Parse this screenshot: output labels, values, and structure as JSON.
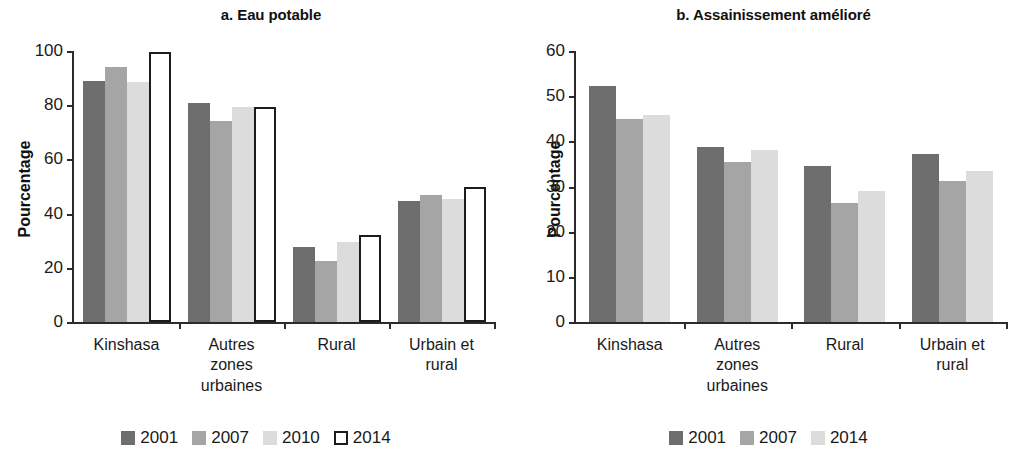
{
  "figure": {
    "panels": [
      "a",
      "b"
    ]
  },
  "chart_data": [
    {
      "type": "bar",
      "panel_id": "a",
      "title": "a. Eau potable",
      "xlabel": "",
      "ylabel": "Pourcentage",
      "ylim": [
        0,
        100
      ],
      "yticks": [
        0,
        20,
        40,
        60,
        80,
        100
      ],
      "ytick_labels": [
        "0",
        "20",
        "40",
        "60",
        "80",
        "100"
      ],
      "grid": false,
      "legend_position": "bottom",
      "categories": [
        "Kinshasa",
        "Autres zones urbaines",
        "Rural",
        "Urbain et rural"
      ],
      "category_lines": [
        [
          "Kinshasa"
        ],
        [
          "Autres",
          "zones",
          "urbaines"
        ],
        [
          "Rural"
        ],
        [
          "Urbain et",
          "rural"
        ]
      ],
      "series": [
        {
          "name": "2001",
          "color": "#6e6e6e",
          "style": "filled",
          "values": [
            89,
            81,
            27.5,
            44.5
          ]
        },
        {
          "name": "2007",
          "color": "#a5a5a5",
          "style": "filled",
          "values": [
            94,
            74,
            22.5,
            47
          ]
        },
        {
          "name": "2010",
          "color": "#dcdcdc",
          "style": "filled",
          "values": [
            88.5,
            79.5,
            29.5,
            45.5
          ]
        },
        {
          "name": "2014",
          "color": "#ffffff",
          "style": "outline",
          "values": [
            99.5,
            79.5,
            32,
            50
          ]
        }
      ]
    },
    {
      "type": "bar",
      "panel_id": "b",
      "title": "b. Assainissement amélioré",
      "xlabel": "",
      "ylabel": "Pourcentage",
      "ylim": [
        0,
        60
      ],
      "yticks": [
        0,
        10,
        20,
        30,
        40,
        50,
        60
      ],
      "ytick_labels": [
        "0",
        "10",
        "20",
        "30",
        "40",
        "50",
        "60"
      ],
      "grid": false,
      "legend_position": "bottom",
      "categories": [
        "Kinshasa",
        "Autres zones urbaines",
        "Rural",
        "Urbain et rural"
      ],
      "category_lines": [
        [
          "Kinshasa"
        ],
        [
          "Autres",
          "zones",
          "urbaines"
        ],
        [
          "Rural"
        ],
        [
          "Urbain et",
          "rural"
        ]
      ],
      "series": [
        {
          "name": "2001",
          "color": "#6e6e6e",
          "style": "filled",
          "values": [
            52.3,
            38.8,
            34.5,
            37.3
          ]
        },
        {
          "name": "2007",
          "color": "#a5a5a5",
          "style": "filled",
          "values": [
            45.0,
            35.5,
            26.3,
            31.3
          ]
        },
        {
          "name": "2014",
          "color": "#dcdcdc",
          "style": "filled",
          "values": [
            45.8,
            38.0,
            29.0,
            33.5
          ]
        }
      ]
    }
  ]
}
